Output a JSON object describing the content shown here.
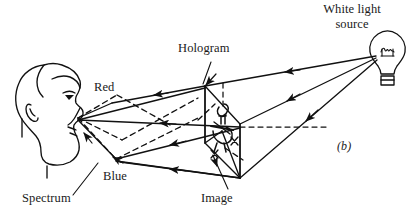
{
  "figure": {
    "panel_label": "(b)",
    "caption_labels": {
      "white_light_source_line1": "White light",
      "white_light_source_line2": "source",
      "hologram": "Hologram",
      "red": "Red",
      "blue": "Blue",
      "spectrum": "Spectrum",
      "image": "Image"
    },
    "colors": {
      "ink": "#111111",
      "background": "#ffffff"
    },
    "elements": {
      "light_bulb": "light-bulb-icon",
      "observer": "head-profile-icon",
      "eye": "eye-icon",
      "hologram_plate": "hologram-plate",
      "reconstructed_image": "reconstructed-image-object",
      "optical_axis": "dashed-optical-axis",
      "spectrum_fan": "dashed-spectrum-fan"
    },
    "ray_arrows": {
      "count": 9,
      "direction_note": "arrowheads on illumination and diffracted rays"
    }
  }
}
